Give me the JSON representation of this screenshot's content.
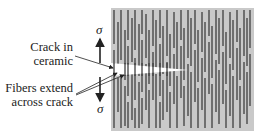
{
  "labels": {
    "crack_line1": "Crack in",
    "crack_line2": "ceramic",
    "fibers_line1": "Fibers extend",
    "fibers_line2": "across crack",
    "sigma_top": "σ",
    "sigma_bottom": "σ"
  },
  "colors": {
    "matrix": "#c9c9c9",
    "fiber": "#3f3f3f",
    "crack": "#ffffff",
    "ink": "#222222"
  },
  "matrix_box": {
    "x": 111,
    "y": 8,
    "w": 143,
    "h": 123
  },
  "crack": {
    "x0": 111,
    "top": 63,
    "bottom": 76,
    "tip_x": 188,
    "tip_y": 70
  },
  "fibers": [
    [
      114,
      10,
      44
    ],
    [
      114,
      50,
      128
    ],
    [
      118,
      22,
      70
    ],
    [
      118,
      78,
      112
    ],
    [
      121,
      10,
      60
    ],
    [
      121,
      68,
      128
    ],
    [
      125,
      30,
      80
    ],
    [
      125,
      86,
      126
    ],
    [
      128,
      10,
      40
    ],
    [
      128,
      46,
      96
    ],
    [
      128,
      102,
      128
    ],
    [
      132,
      18,
      62
    ],
    [
      132,
      70,
      120
    ],
    [
      135,
      10,
      50
    ],
    [
      135,
      58,
      100
    ],
    [
      135,
      108,
      128
    ],
    [
      139,
      24,
      76
    ],
    [
      139,
      82,
      128
    ],
    [
      142,
      10,
      34
    ],
    [
      142,
      40,
      92
    ],
    [
      142,
      98,
      124
    ],
    [
      146,
      14,
      58
    ],
    [
      146,
      64,
      110
    ],
    [
      149,
      30,
      84
    ],
    [
      149,
      90,
      128
    ],
    [
      153,
      10,
      46
    ],
    [
      153,
      52,
      100
    ],
    [
      156,
      20,
      68
    ],
    [
      156,
      74,
      128
    ],
    [
      160,
      10,
      38
    ],
    [
      160,
      44,
      96
    ],
    [
      160,
      102,
      128
    ],
    [
      163,
      26,
      74
    ],
    [
      163,
      80,
      120
    ],
    [
      167,
      10,
      56
    ],
    [
      167,
      62,
      112
    ],
    [
      170,
      34,
      86
    ],
    [
      170,
      92,
      128
    ],
    [
      174,
      12,
      48
    ],
    [
      174,
      54,
      104
    ],
    [
      177,
      22,
      70
    ],
    [
      177,
      76,
      128
    ],
    [
      181,
      10,
      40
    ],
    [
      181,
      46,
      98
    ],
    [
      184,
      28,
      80
    ],
    [
      184,
      86,
      126
    ],
    [
      188,
      10,
      58
    ],
    [
      188,
      64,
      116
    ],
    [
      191,
      18,
      66
    ],
    [
      191,
      72,
      128
    ],
    [
      195,
      10,
      44
    ],
    [
      195,
      50,
      102
    ],
    [
      198,
      30,
      82
    ],
    [
      198,
      88,
      128
    ],
    [
      202,
      12,
      52
    ],
    [
      202,
      58,
      110
    ],
    [
      205,
      22,
      72
    ],
    [
      205,
      78,
      128
    ],
    [
      209,
      10,
      36
    ],
    [
      209,
      42,
      94
    ],
    [
      212,
      26,
      78
    ],
    [
      212,
      84,
      128
    ],
    [
      216,
      10,
      54
    ],
    [
      216,
      60,
      112
    ],
    [
      219,
      18,
      64
    ],
    [
      219,
      70,
      124
    ],
    [
      223,
      10,
      46
    ],
    [
      223,
      52,
      104
    ],
    [
      226,
      32,
      84
    ],
    [
      226,
      90,
      128
    ],
    [
      230,
      12,
      58
    ],
    [
      230,
      64,
      116
    ],
    [
      233,
      20,
      70
    ],
    [
      233,
      76,
      128
    ],
    [
      237,
      10,
      42
    ],
    [
      237,
      48,
      100
    ],
    [
      240,
      28,
      80
    ],
    [
      240,
      86,
      128
    ],
    [
      244,
      10,
      56
    ],
    [
      244,
      62,
      114
    ],
    [
      247,
      18,
      66
    ],
    [
      247,
      72,
      124
    ],
    [
      250,
      10,
      48
    ],
    [
      250,
      54,
      106
    ]
  ],
  "arrows": {
    "up": {
      "x": 100,
      "y1": 63,
      "y2": 39
    },
    "down": {
      "x": 100,
      "y1": 77,
      "y2": 101
    },
    "crack_pointer": {
      "x1": 75,
      "y1": 56,
      "x2": 113,
      "y2": 68
    },
    "fiber_pointer_1": {
      "x1": 76,
      "y1": 94,
      "x2": 117,
      "y2": 73
    },
    "fiber_pointer_2": {
      "x1": 76,
      "y1": 95,
      "x2": 124,
      "y2": 75
    }
  }
}
